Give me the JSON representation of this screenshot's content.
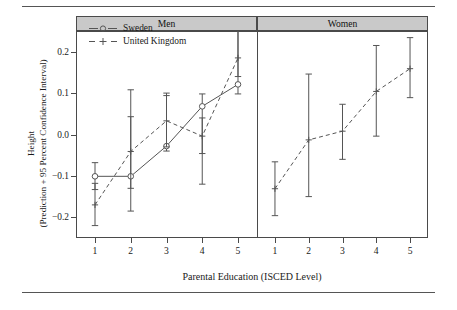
{
  "axes": {
    "ylabel_line1": "Height",
    "ylabel_line2": "(Prediction + 95 Percent Confidence Interval)",
    "xlabel": "Parental Education (ISCED Level)",
    "yticks": [
      "0.2",
      "0.1",
      "0.0",
      "-0.1",
      "-0.2"
    ],
    "xticks": [
      "1",
      "2",
      "3",
      "4",
      "5"
    ]
  },
  "panels": [
    {
      "name": "men-panel",
      "label": "Men"
    },
    {
      "name": "women-panel",
      "label": "Women"
    }
  ],
  "legend": [
    {
      "name": "legend-sweden",
      "label": "Sweden",
      "style": "solid",
      "marker": "open-circle"
    },
    {
      "name": "legend-united-kingdom",
      "label": "United Kingdom",
      "style": "dashed",
      "marker": "plus"
    }
  ],
  "colors": {
    "line": "#555555",
    "strip_fill": "#c9c9c9",
    "frame": "#4a4a4a",
    "text": "#1a1a1a"
  },
  "chart_data": {
    "type": "line",
    "title": "",
    "xlabel": "Parental Education (ISCED Level)",
    "ylabel": "Height (Prediction + 95 Percent Confidence Interval)",
    "x": [
      1,
      2,
      3,
      4,
      5
    ],
    "ylim": [
      -0.25,
      0.25
    ],
    "yticks": [
      0.2,
      0.1,
      0.0,
      -0.1,
      -0.2
    ],
    "grid": false,
    "legend_position": "top-left",
    "error_bars": "95% confidence interval",
    "facets": [
      {
        "facet": "Men",
        "series": [
          {
            "name": "Sweden",
            "linestyle": "solid",
            "marker": "open-circle",
            "values": [
              -0.101,
              -0.101,
              -0.028,
              0.068,
              0.121
            ],
            "ci_low": [
              -0.133,
              -0.185,
              -0.04,
              -0.12,
              0.098
            ],
            "ci_high": [
              -0.068,
              0.108,
              0.1,
              0.098,
              0.25
            ]
          },
          {
            "name": "United Kingdom",
            "linestyle": "dashed",
            "marker": "plus",
            "values": [
              -0.17,
              -0.041,
              0.033,
              -0.004,
              0.185
            ],
            "ci_low": [
              -0.22,
              -0.13,
              -0.03,
              -0.046,
              0.14
            ],
            "ci_high": [
              -0.118,
              0.043,
              0.094,
              0.04,
              0.25
            ]
          }
        ]
      },
      {
        "facet": "Women",
        "series": [
          {
            "name": "United Kingdom",
            "linestyle": "dashed",
            "marker": "plus",
            "values": [
              -0.131,
              -0.013,
              0.008,
              0.104,
              0.159
            ],
            "ci_low": [
              -0.196,
              -0.15,
              -0.06,
              -0.004,
              0.089
            ],
            "ci_high": [
              -0.066,
              0.146,
              0.073,
              0.215,
              0.234
            ]
          }
        ]
      }
    ]
  }
}
